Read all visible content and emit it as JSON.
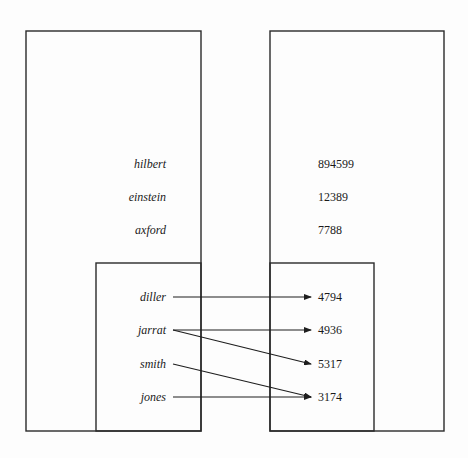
{
  "diagram": {
    "left_structure": {
      "outer_box": {
        "x": 26,
        "y": 31,
        "w": 175,
        "h": 400
      },
      "inner_box": {
        "x": 96,
        "y": 263,
        "w": 105,
        "h": 168
      },
      "outer_labels": [
        {
          "text": "hilbert",
          "y": 164
        },
        {
          "text": "einstein",
          "y": 197
        },
        {
          "text": "axford",
          "y": 230
        }
      ],
      "inner_labels": [
        {
          "text": "diller",
          "y": 297
        },
        {
          "text": "jarrat",
          "y": 330
        },
        {
          "text": "smith",
          "y": 364
        },
        {
          "text": "jones",
          "y": 397
        }
      ]
    },
    "right_structure": {
      "outer_box": {
        "x": 270,
        "y": 31,
        "w": 174,
        "h": 400
      },
      "inner_box": {
        "x": 270,
        "y": 263,
        "w": 104,
        "h": 168
      },
      "outer_values": [
        {
          "text": "894599",
          "y": 164
        },
        {
          "text": "12389",
          "y": 197
        },
        {
          "text": "7788",
          "y": 230
        }
      ],
      "inner_values": [
        {
          "text": "4794",
          "y": 297
        },
        {
          "text": "4936",
          "y": 330
        },
        {
          "text": "5317",
          "y": 364
        },
        {
          "text": "3174",
          "y": 397
        }
      ]
    },
    "arrows": [
      {
        "from": "diller",
        "to": "4794",
        "x1": 173,
        "y1": 297,
        "x2": 311,
        "y2": 297
      },
      {
        "from": "jarrat",
        "to": "4936",
        "x1": 173,
        "y1": 330,
        "x2": 311,
        "y2": 330
      },
      {
        "from": "jarrat",
        "to": "5317",
        "x1": 173,
        "y1": 330,
        "x2": 311,
        "y2": 364
      },
      {
        "from": "smith",
        "to": "3174",
        "x1": 173,
        "y1": 364,
        "x2": 311,
        "y2": 397
      },
      {
        "from": "jones",
        "to": "3174",
        "x1": 173,
        "y1": 397,
        "x2": 311,
        "y2": 397
      }
    ],
    "colors": {
      "stroke": "#2a2a2a",
      "text": "#1a1a1a",
      "background": "#fdfdfd"
    }
  }
}
